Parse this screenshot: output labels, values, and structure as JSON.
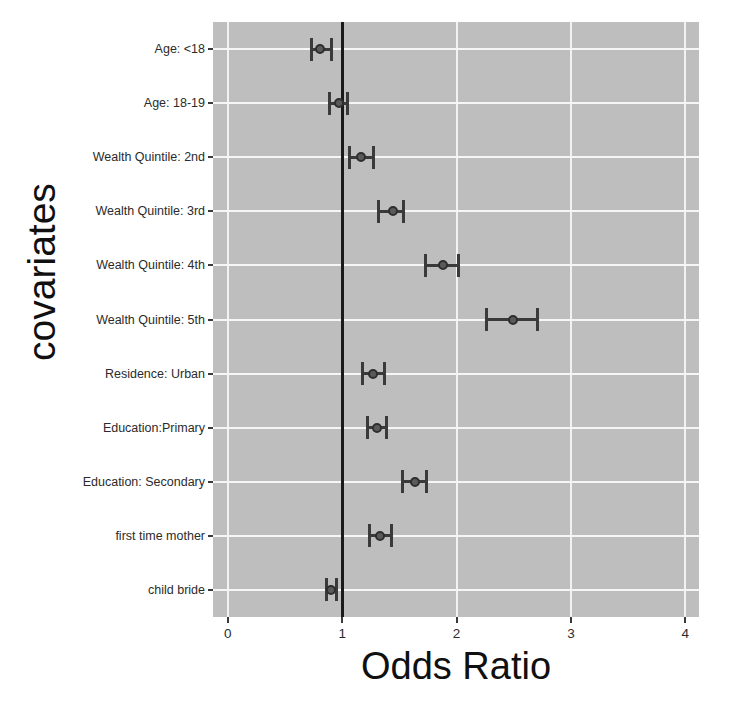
{
  "chart_data": {
    "type": "scatter",
    "subtype": "forest-plot",
    "title": "",
    "xlabel": "Odds Ratio",
    "ylabel": "covariates",
    "xlim": [
      -0.13,
      4.12
    ],
    "ylim_categories_top_to_bottom": true,
    "grid": true,
    "legend": "none",
    "reference_line": 1,
    "xticks": [
      {
        "value": 0,
        "label": "0"
      },
      {
        "value": 1,
        "label": "1"
      },
      {
        "value": 2,
        "label": "2"
      },
      {
        "value": 3,
        "label": "3"
      },
      {
        "value": 4,
        "label": "4"
      }
    ],
    "categories": [
      "Age: <18",
      "Age: 18-19",
      "Wealth Quintile: 2nd",
      "Wealth Quintile: 3rd",
      "Wealth Quintile: 4th",
      "Wealth Quintile: 5th",
      "Residence: Urban",
      "Education:Primary",
      "Education: Secondary",
      "first time mother",
      "child bride"
    ],
    "points": [
      {
        "category": "Age: <18",
        "estimate": 0.81,
        "ci_low": 0.73,
        "ci_high": 0.91
      },
      {
        "category": "Age: 18-19",
        "estimate": 0.97,
        "ci_low": 0.89,
        "ci_high": 1.05
      },
      {
        "category": "Wealth Quintile: 2nd",
        "estimate": 1.16,
        "ci_low": 1.06,
        "ci_high": 1.27
      },
      {
        "category": "Wealth Quintile: 3rd",
        "estimate": 1.44,
        "ci_low": 1.32,
        "ci_high": 1.54
      },
      {
        "category": "Wealth Quintile: 4th",
        "estimate": 1.88,
        "ci_low": 1.73,
        "ci_high": 2.02
      },
      {
        "category": "Wealth Quintile: 5th",
        "estimate": 2.49,
        "ci_low": 2.26,
        "ci_high": 2.71
      },
      {
        "category": "Residence: Urban",
        "estimate": 1.27,
        "ci_low": 1.18,
        "ci_high": 1.37
      },
      {
        "category": "Education:Primary",
        "estimate": 1.3,
        "ci_low": 1.22,
        "ci_high": 1.39
      },
      {
        "category": "Education: Secondary",
        "estimate": 1.64,
        "ci_low": 1.53,
        "ci_high": 1.74
      },
      {
        "category": "first time mother",
        "estimate": 1.33,
        "ci_low": 1.24,
        "ci_high": 1.43
      },
      {
        "category": "child bride",
        "estimate": 0.9,
        "ci_low": 0.86,
        "ci_high": 0.95
      }
    ],
    "colors": {
      "panel_background": "#bebebe",
      "gridline": "#f2f2f2",
      "reference_line": "#1a1a1a",
      "marker": "#5a5a5a",
      "error_bar": "#3a3a3a",
      "figure_background": "#ffffff",
      "text": "#2b2b2b"
    }
  }
}
